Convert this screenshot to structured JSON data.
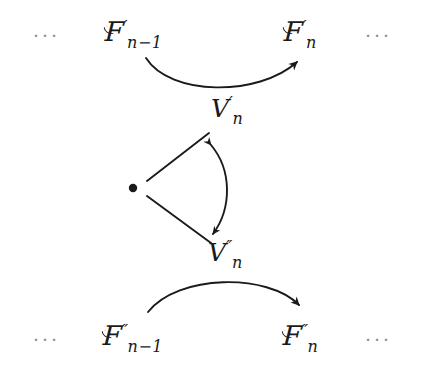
{
  "diagram": {
    "type": "commutative-diagram",
    "ink_color": "#1a1a1a",
    "faded_color": "#8e8e8e",
    "background": "#ffffff",
    "rows": [
      {
        "id": "top-row",
        "left_ellipsis": "···",
        "right_ellipsis": "···",
        "source": {
          "base": "F",
          "prime": "′",
          "subscript_main": "n",
          "subscript_op": "−",
          "subscript_tail": "1"
        },
        "target": {
          "base": "F",
          "prime": "′",
          "subscript_main": "n",
          "subscript_op": "",
          "subscript_tail": ""
        },
        "arrow_label": {
          "base": "V",
          "prime": "′",
          "subscript": "n"
        },
        "arrow_direction": "left-to-right",
        "arrow_curvature": "concave-up"
      },
      {
        "id": "bottom-row",
        "left_ellipsis": "···",
        "right_ellipsis": "···",
        "source": {
          "base": "F",
          "prime": "″",
          "subscript_main": "n",
          "subscript_op": "−",
          "subscript_tail": "1"
        },
        "target": {
          "base": "F",
          "prime": "″",
          "subscript_main": "n",
          "subscript_op": "",
          "subscript_tail": ""
        },
        "arrow_label": {
          "base": "V",
          "prime": "″",
          "subscript": "n"
        },
        "arrow_direction": "left-to-right",
        "arrow_curvature": "convex-up"
      }
    ],
    "apex": {
      "id": "apex-point",
      "shape": "filled-dot",
      "x": 133,
      "y": 188,
      "radius": 4
    },
    "connectors": [
      {
        "id": "apex-to-upper",
        "kind": "straight-line",
        "from": [
          148,
          180
        ],
        "to": [
          209,
          133
        ]
      },
      {
        "id": "apex-to-lower",
        "kind": "straight-line",
        "from": [
          148,
          197
        ],
        "to": [
          211,
          243
        ]
      },
      {
        "id": "upper-lower-link",
        "kind": "curved-double-arrow",
        "from": [
          210,
          143
        ],
        "to": [
          213,
          236
        ],
        "bulge": "right"
      }
    ]
  }
}
